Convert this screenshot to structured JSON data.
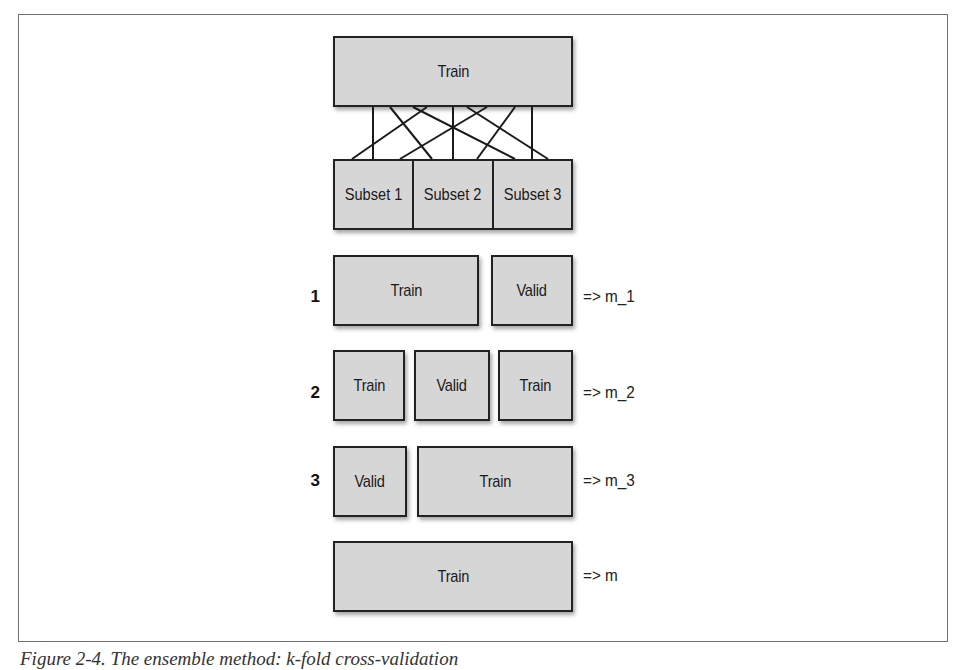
{
  "diagram": {
    "top_box": {
      "label": "Train"
    },
    "subsets": [
      {
        "label": "Subset 1"
      },
      {
        "label": "Subset 2"
      },
      {
        "label": "Subset 3"
      }
    ],
    "folds": [
      {
        "number": "1",
        "segments": [
          {
            "label": "Train",
            "role": "train"
          },
          {
            "label": "Valid",
            "role": "valid"
          }
        ],
        "result": "=> m_1"
      },
      {
        "number": "2",
        "segments": [
          {
            "label": "Train",
            "role": "train"
          },
          {
            "label": "Valid",
            "role": "valid"
          },
          {
            "label": "Train",
            "role": "train"
          }
        ],
        "result": "=> m_2"
      },
      {
        "number": "3",
        "segments": [
          {
            "label": "Valid",
            "role": "valid"
          },
          {
            "label": "Train",
            "role": "train"
          }
        ],
        "result": "=> m_3"
      }
    ],
    "final": {
      "label": "Train",
      "result": "=> m"
    },
    "connections": "Each subset is connected to every region of the original Train set (random shuffle split into 3 subsets)",
    "colors": {
      "box_fill": "#d6d6d6",
      "box_border": "#222222",
      "frame": "#6f6f6f"
    }
  },
  "caption": {
    "text": "Figure 2-4. The ensemble method: k-fold cross-validation"
  }
}
